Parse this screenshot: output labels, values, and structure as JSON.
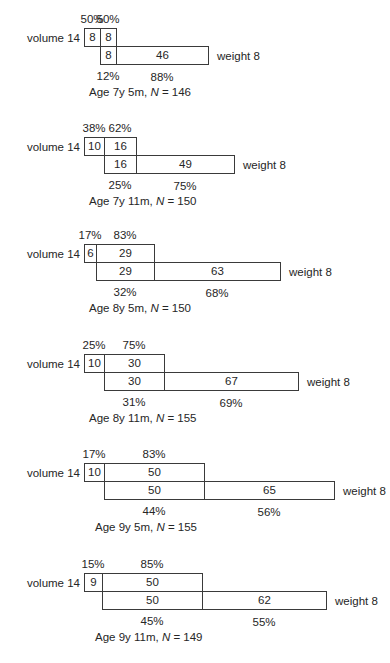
{
  "diagram": {
    "row_label_top": "volume 14",
    "row_label_bottom": "weight 8",
    "panels": [
      {
        "age": "Age 7y 5m",
        "n_label": "N",
        "n_value": "146",
        "volume_left": 8,
        "overlap": 8,
        "weight_right": 46,
        "top_pct": [
          "50%",
          "50%"
        ],
        "bottom_pct": [
          "12%",
          "88%"
        ]
      },
      {
        "age": "Age 7y 11m",
        "n_label": "N",
        "n_value": "150",
        "volume_left": 10,
        "overlap": 16,
        "weight_right": 49,
        "top_pct": [
          "38%",
          "62%"
        ],
        "bottom_pct": [
          "25%",
          "75%"
        ]
      },
      {
        "age": "Age 8y 5m",
        "n_label": "N",
        "n_value": "150",
        "volume_left": 6,
        "overlap": 29,
        "weight_right": 63,
        "top_pct": [
          "17%",
          "83%"
        ],
        "bottom_pct": [
          "32%",
          "68%"
        ]
      },
      {
        "age": "Age 8y 11m",
        "n_label": "N",
        "n_value": "155",
        "volume_left": 10,
        "overlap": 30,
        "weight_right": 67,
        "top_pct": [
          "25%",
          "75%"
        ],
        "bottom_pct": [
          "31%",
          "69%"
        ]
      },
      {
        "age": "Age 9y 5m",
        "n_label": "N",
        "n_value": "155",
        "volume_left": 10,
        "overlap": 50,
        "weight_right": 65,
        "top_pct": [
          "17%",
          "83%"
        ],
        "bottom_pct": [
          "44%",
          "56%"
        ]
      },
      {
        "age": "Age 9y 11m",
        "n_label": "N",
        "n_value": "149",
        "volume_left": 9,
        "overlap": 50,
        "weight_right": 62,
        "top_pct": [
          "15%",
          "85%"
        ],
        "bottom_pct": [
          "45%",
          "55%"
        ]
      }
    ]
  }
}
